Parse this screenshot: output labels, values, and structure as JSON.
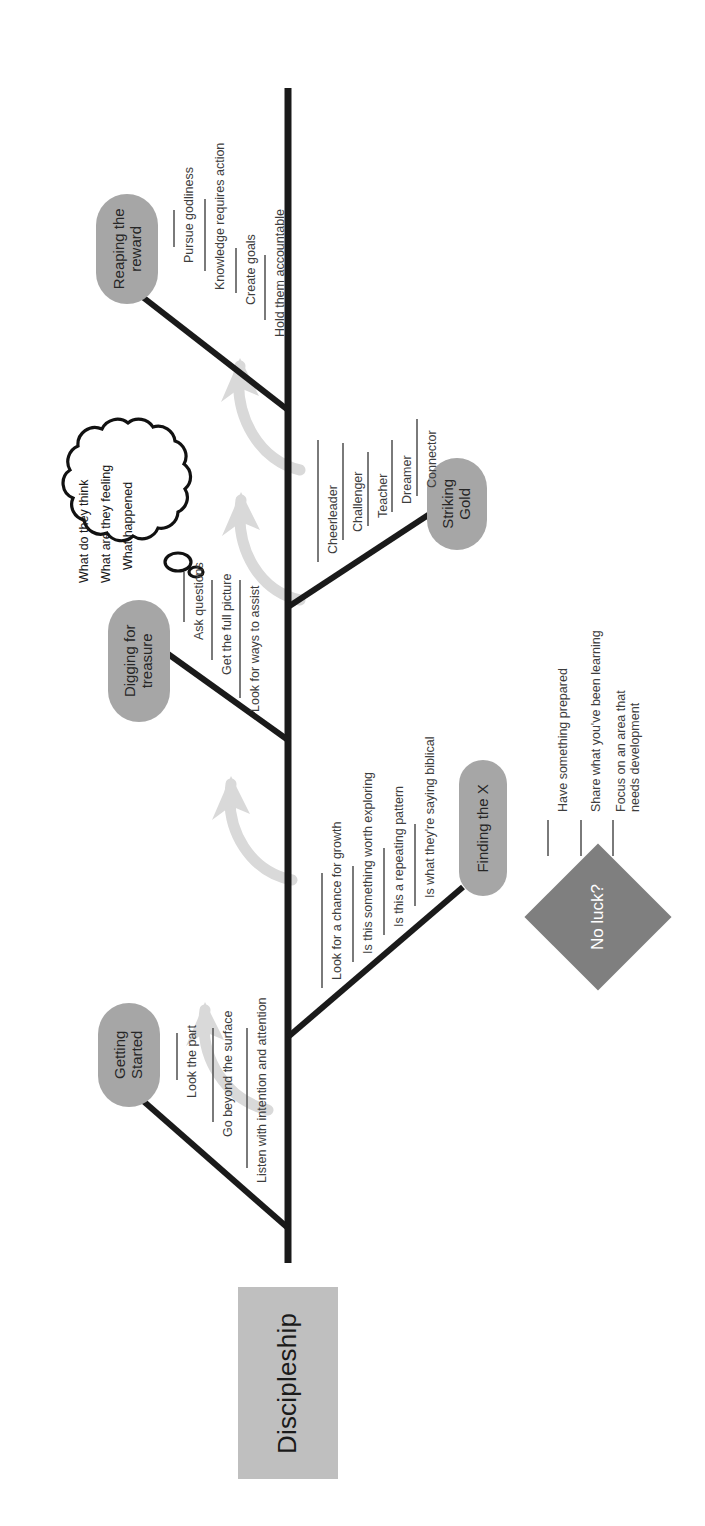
{
  "diagram": {
    "type": "fishbone",
    "title": "Discipleship",
    "orientation": "rotated-90-ccw",
    "head_label": "Discipleship",
    "colors": {
      "spine": "#1a1a1a",
      "head_box": "#bfbfbf",
      "category_pill": "#a6a6a6",
      "decision_diamond": "#7f7f7f",
      "flow_arrow": "#d9d9d9",
      "label_text": "#3d3d3d"
    }
  },
  "branches": [
    {
      "id": "getting-started",
      "label": "Getting Started",
      "side": "upper",
      "items": [
        "Look the part",
        "Go beyond the surface",
        "Listen with intention and attention"
      ]
    },
    {
      "id": "digging-for-treasure",
      "label": "Digging for treasure",
      "side": "upper",
      "items": [
        "Ask questions",
        "Get the full picture",
        "Look for ways to assist"
      ]
    },
    {
      "id": "reaping-the-reward",
      "label": "Reaping the reward",
      "side": "upper",
      "items": [
        "Pursue godliness",
        "Knowledge requires action",
        "Create goals",
        "Hold them accountable"
      ]
    },
    {
      "id": "finding-the-x",
      "label": "Finding the X",
      "side": "lower",
      "items": [
        "Look for a chance for growth",
        "Is this something worth exploring",
        "Is this a repeating pattern",
        "Is what they're saying biblical"
      ]
    },
    {
      "id": "striking-gold",
      "label": "Striking Gold",
      "side": "lower",
      "items": [
        "Cheerleader",
        "Challenger",
        "Teacher",
        "Dreamer",
        "Connector"
      ]
    }
  ],
  "thought_cloud": {
    "id": "thought-cloud",
    "lines": [
      "What do they think",
      "What are they feeling",
      "What happened"
    ]
  },
  "decision": {
    "id": "no-luck",
    "label": "No luck?",
    "items": [
      "Have something prepared",
      "Share what you've been learning",
      "Focus on an area that needs development"
    ]
  }
}
